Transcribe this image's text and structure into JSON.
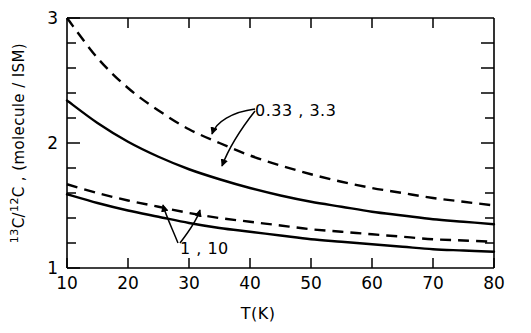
{
  "chart_data": {
    "type": "line",
    "title": "",
    "xlabel": "T(K)",
    "ylabel": "13C/12C, (molecule / ISM)",
    "ylabel_parts": {
      "sup1": "13",
      "mid1": "C/",
      "sup2": "12",
      "rest": "C , (molecule / ISM)"
    },
    "xlim": [
      10,
      80
    ],
    "ylim": [
      1,
      3
    ],
    "xticks": [
      10,
      20,
      30,
      40,
      50,
      60,
      70,
      80
    ],
    "xticklabels": [
      "10",
      "20",
      "30",
      "40",
      "50",
      "60",
      "70",
      "80"
    ],
    "yticks": [
      1,
      2,
      3
    ],
    "yticklabels": [
      "1",
      "2",
      "3"
    ],
    "yminorticks": [
      1.2,
      1.4,
      1.6,
      1.8,
      2.2,
      2.4,
      2.6,
      2.8
    ],
    "grid": false,
    "legend_position": "inline-annotations",
    "annotations": [
      {
        "name": "upper-pair-label",
        "text": "0.33 , 3.3",
        "x": 36.5,
        "y": 2.28,
        "points_to": [
          "curve-dashed-upper",
          "curve-solid-upper"
        ]
      },
      {
        "name": "lower-pair-label",
        "text": "1 , 10",
        "x": 27.5,
        "y": 1.18,
        "points_to": [
          "curve-dashed-lower",
          "curve-solid-lower"
        ]
      }
    ],
    "series": [
      {
        "name": "0.33 (dashed, upper)",
        "style": "dashed",
        "label_group": "0.33 , 3.3",
        "x": [
          10,
          15,
          20,
          25,
          30,
          35,
          40,
          45,
          50,
          55,
          60,
          65,
          70,
          75,
          80
        ],
        "values": [
          3.0,
          2.68,
          2.44,
          2.26,
          2.11,
          2.0,
          1.9,
          1.82,
          1.75,
          1.69,
          1.64,
          1.6,
          1.56,
          1.53,
          1.5
        ]
      },
      {
        "name": "3.3 (solid, upper)",
        "style": "solid",
        "label_group": "0.33 , 3.3",
        "x": [
          10,
          15,
          20,
          25,
          30,
          35,
          40,
          45,
          50,
          55,
          60,
          65,
          70,
          75,
          80
        ],
        "values": [
          2.34,
          2.16,
          2.01,
          1.89,
          1.79,
          1.71,
          1.64,
          1.58,
          1.53,
          1.49,
          1.45,
          1.42,
          1.39,
          1.37,
          1.35
        ]
      },
      {
        "name": "1 (dashed, lower)",
        "style": "dashed",
        "label_group": "1 , 10",
        "x": [
          10,
          15,
          20,
          25,
          30,
          35,
          40,
          45,
          50,
          55,
          60,
          65,
          70,
          75,
          80
        ],
        "values": [
          1.67,
          1.6,
          1.54,
          1.49,
          1.44,
          1.4,
          1.37,
          1.34,
          1.31,
          1.29,
          1.27,
          1.25,
          1.23,
          1.22,
          1.21
        ]
      },
      {
        "name": "10 (solid, lower)",
        "style": "solid",
        "label_group": "1 , 10",
        "x": [
          10,
          15,
          20,
          25,
          30,
          35,
          40,
          45,
          50,
          55,
          60,
          65,
          70,
          75,
          80
        ],
        "values": [
          1.59,
          1.52,
          1.46,
          1.41,
          1.36,
          1.32,
          1.29,
          1.26,
          1.23,
          1.21,
          1.19,
          1.17,
          1.15,
          1.14,
          1.13
        ]
      }
    ]
  }
}
